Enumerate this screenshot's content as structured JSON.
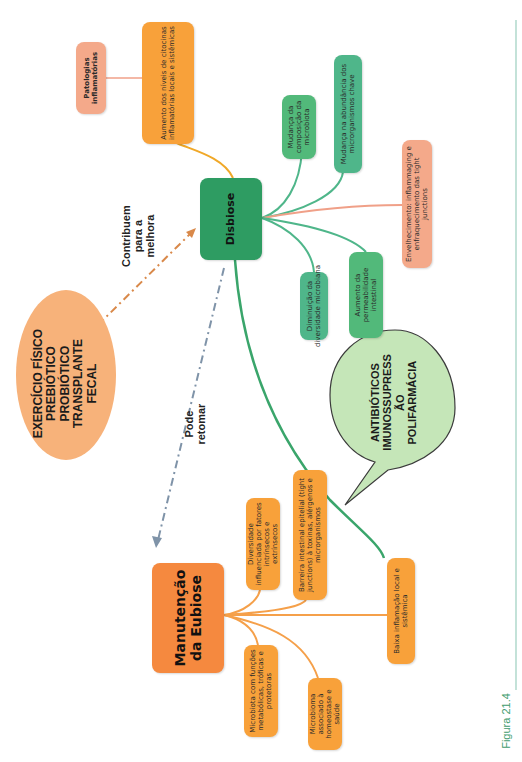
{
  "figure": {
    "caption": "Figura 21.4",
    "rule_color": "#9ccfbf"
  },
  "colors": {
    "orange": "#f8a13a",
    "orange_hub": "#f5893f",
    "salmon": "#f4a98a",
    "green": "#52b97a",
    "green_hub": "#2e9c62",
    "arrow_orange": "#d9894a",
    "arrow_blue": "#7f93a8",
    "bubble_green": "#c5e6b8",
    "ellipse_orange": "#f7b27a"
  },
  "disbiose": {
    "hub": "Disbiose",
    "branches": [
      "Mudança da composição da microbiota",
      "Mudança na abundância dos microrganismos chave",
      "Envelhecimento: inflammaging e enfraquecimento das tight junctions",
      "Aumento da permeabilidade intestinal",
      "Diminuição da diversidade microbiana"
    ],
    "cytokines": "Aumento dos níveis de citocinas inflamatórias locais e sistêmicas",
    "pathologies": "Patologias inflamatórias"
  },
  "eubiose": {
    "hub": "Manutenção da Eubiose",
    "branches": [
      "Diversidade influenciada por fatores intrínsecos e extrínsecos",
      "Barreira intestinal epitelial (tight junctions) à toxinas, alérgenos e microrganismos",
      "Baixa inflamação local e sistêmica",
      "Microbiota com funções metabólicas, tróficas e protetoras",
      "Microbioma associado à homeostase e saúde"
    ]
  },
  "interventions": {
    "lines": [
      "EXERCÍCIO FÍSICO",
      "PREBIÓTICO",
      "PROBIÓTICO",
      "TRANSPLANTE",
      "FECAL"
    ],
    "arrow_label_lines": [
      "Contribuem",
      "para a",
      "melhora"
    ]
  },
  "risk_factors": {
    "lines": [
      "ANTIBIÓTICOS",
      "IMUNOSSUPRESS",
      "ÃO",
      "POLIFARMÁCIA"
    ]
  },
  "return_arrow": {
    "label": "Pode retomar"
  }
}
